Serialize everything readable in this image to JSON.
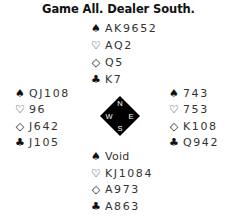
{
  "title": "Game All. Dealer South.",
  "suits": {
    "spade": "♠",
    "heart": "♡",
    "diamond": "◇",
    "club": "♣"
  },
  "hands": {
    "north": {
      "spades": "AK9652",
      "hearts": "AQ2",
      "diamonds": "Q5",
      "clubs": "K7"
    },
    "west": {
      "spades": "QJ108",
      "hearts": "96",
      "diamonds": "J642",
      "clubs": "J105"
    },
    "east": {
      "spades": "743",
      "hearts": "753",
      "diamonds": "K108",
      "clubs": "Q942"
    },
    "south": {
      "spades": "Void",
      "hearts": "KJ1084",
      "diamonds": "A973",
      "clubs": "A863"
    }
  },
  "compass": {
    "n": "N",
    "e": "E",
    "s": "S",
    "w": "W",
    "color": "#000000"
  }
}
